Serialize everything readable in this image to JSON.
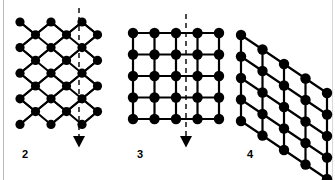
{
  "figure": {
    "width": 335,
    "height": 180,
    "background_color": "#ffffff",
    "node_color": "#000000",
    "bond_color": "#000000",
    "guide_color": "#000000",
    "border_color": "#b9b9b9"
  },
  "panels": [
    {
      "id": "triangular-lattice",
      "label": "2",
      "label_x": 22,
      "label_y": 149,
      "lattice_type": "triangular",
      "rows": 9,
      "cols": 3,
      "node_radius": 4.6,
      "bond_width": 2.0,
      "origin_x": 20,
      "origin_y": 22,
      "col_spacing": 31,
      "row_spacing": 12.8,
      "guide_line": {
        "type": "dashed-arrow",
        "x": 79,
        "y_start": 8,
        "y_end": 142,
        "dash": "5,4",
        "width": 1.4,
        "arrow_size": 6
      }
    },
    {
      "id": "square-lattice",
      "label": "3",
      "label_x": 137,
      "label_y": 149,
      "lattice_type": "square",
      "rows": 5,
      "cols": 5,
      "node_radius": 5.2,
      "bond_width": 2.2,
      "origin_x": 133,
      "origin_y": 33,
      "col_spacing": 21.5,
      "row_spacing": 21.5,
      "guide_line": {
        "type": "dashed-arrow",
        "x": 186,
        "y_start": 14,
        "y_end": 142,
        "dash": "5,4",
        "width": 1.4,
        "arrow_size": 6
      }
    },
    {
      "id": "oblique-lattice",
      "label": "4",
      "label_x": 247,
      "label_y": 149,
      "lattice_type": "oblique",
      "rows": 5,
      "cols": 5,
      "node_radius": 5.2,
      "bond_width": 2.2,
      "origin_x": 241,
      "origin_y": 35,
      "col_spacing": 21.5,
      "row_spacing": 21.5,
      "shear_x": 0,
      "shear_y": 14.5,
      "guide_line": null
    }
  ]
}
